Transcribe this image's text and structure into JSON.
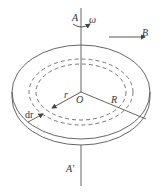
{
  "diagram": {
    "labels": {
      "axis_top": "A",
      "axis_bottom": "A'",
      "angular_velocity": "ω",
      "field": "B",
      "center": "O",
      "radius_small": "r",
      "radius_large": "R",
      "ring_width": "dr"
    },
    "colors": {
      "line": "#555555",
      "text": "#333333",
      "background": "#ffffff"
    },
    "elements": [
      "vertical rotation axis AA'",
      "curved arrow indicating angular velocity ω",
      "horizontal arrow for magnetic field B",
      "disk with thickness (two stacked ellipses)",
      "two dashed concentric rings (annulus of width dr)",
      "radius r to inner dashed ring",
      "radius R to outer edge"
    ]
  }
}
